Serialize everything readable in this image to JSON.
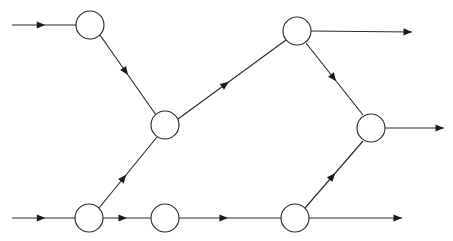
{
  "diagram": {
    "type": "directed-graph",
    "canvas": {
      "width": 453,
      "height": 241,
      "background": "#ffffff"
    },
    "style": {
      "line_color": "#2b2b2b",
      "node_fill": "#ffffff",
      "node_stroke": "#2b2b2b",
      "arrow_color": "#1a1a1a",
      "line_width": 1.15,
      "node_radius": 14
    },
    "nodes": [
      {
        "id": "n1",
        "label": "",
        "cx": 90,
        "cy": 25,
        "r": 14,
        "name": "node-top-left"
      },
      {
        "id": "n2",
        "label": "",
        "cx": 165,
        "cy": 125,
        "r": 14,
        "name": "node-center"
      },
      {
        "id": "n3",
        "label": "",
        "cx": 297,
        "cy": 31,
        "r": 14,
        "name": "node-top-right"
      },
      {
        "id": "n4",
        "label": "",
        "cx": 371,
        "cy": 128,
        "r": 14,
        "name": "node-right"
      },
      {
        "id": "n5",
        "label": "",
        "cx": 89,
        "cy": 218,
        "r": 14,
        "name": "node-bottom-left"
      },
      {
        "id": "n6",
        "label": "",
        "cx": 165,
        "cy": 218,
        "r": 14,
        "name": "node-bottom-middle"
      },
      {
        "id": "n7",
        "label": "",
        "cx": 295,
        "cy": 218,
        "r": 14,
        "name": "node-bottom-right"
      }
    ],
    "edges": [
      {
        "id": "e1",
        "from": "n1",
        "to": "n2",
        "x1": 100,
        "y1": 35,
        "x2": 156,
        "y2": 115,
        "arrow_t": 0.5,
        "name": "edge-top-left-to-center"
      },
      {
        "id": "e2",
        "from": "n2",
        "to": "n3",
        "x1": 178,
        "y1": 119,
        "x2": 286,
        "y2": 40,
        "arrow_t": 0.47,
        "name": "edge-center-to-top-right"
      },
      {
        "id": "e3",
        "from": "n5",
        "to": "n2",
        "x1": 99,
        "y1": 208,
        "x2": 157,
        "y2": 137,
        "arrow_t": 0.47,
        "name": "edge-bottom-left-to-center"
      },
      {
        "id": "e4",
        "from": "n3",
        "to": "n4",
        "x1": 306,
        "y1": 43,
        "x2": 363,
        "y2": 115,
        "arrow_t": 0.53,
        "name": "edge-top-right-to-right"
      },
      {
        "id": "e5",
        "from": "n7",
        "to": "n4",
        "x1": 305,
        "y1": 208,
        "x2": 363,
        "y2": 141,
        "arrow_t": 0.52,
        "name": "edge-bottom-right-to-right"
      },
      {
        "id": "e6",
        "from": "n5",
        "to": "n6",
        "x1": 103,
        "y1": 218,
        "x2": 151,
        "y2": 218,
        "arrow_t": 0.5,
        "name": "edge-bottom-left-to-bottom-middle"
      },
      {
        "id": "e7",
        "from": "n6",
        "to": "n7",
        "x1": 179,
        "y1": 218,
        "x2": 281,
        "y2": 218,
        "arrow_t": 0.48,
        "name": "edge-bottom-middle-to-bottom-right"
      }
    ],
    "input_arrows": [
      {
        "id": "in1",
        "to": "n1",
        "x1": 12,
        "y1": 25,
        "x2": 76,
        "y2": 25,
        "arrow_t": 0.52,
        "name": "input-arrow-top"
      },
      {
        "id": "in2",
        "to": "n5",
        "x1": 12,
        "y1": 218,
        "x2": 75,
        "y2": 218,
        "arrow_t": 0.53,
        "name": "input-arrow-bottom"
      }
    ],
    "output_arrows": [
      {
        "id": "out1",
        "from": "n3",
        "x1": 311,
        "y1": 31,
        "x2": 412,
        "y2": 32,
        "arrow_t": 1.0,
        "name": "output-arrow-top-right"
      },
      {
        "id": "out2",
        "from": "n4",
        "x1": 385,
        "y1": 128,
        "x2": 444,
        "y2": 128,
        "arrow_t": 1.0,
        "name": "output-arrow-right"
      },
      {
        "id": "out3",
        "from": "n7",
        "x1": 309,
        "y1": 218,
        "x2": 402,
        "y2": 218,
        "arrow_t": 1.0,
        "name": "output-arrow-bottom-right"
      }
    ]
  }
}
